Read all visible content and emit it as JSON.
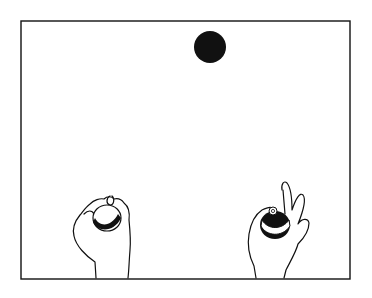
{
  "figure": {
    "colors": {
      "ink": "#111111",
      "paper": "#ffffff"
    }
  }
}
